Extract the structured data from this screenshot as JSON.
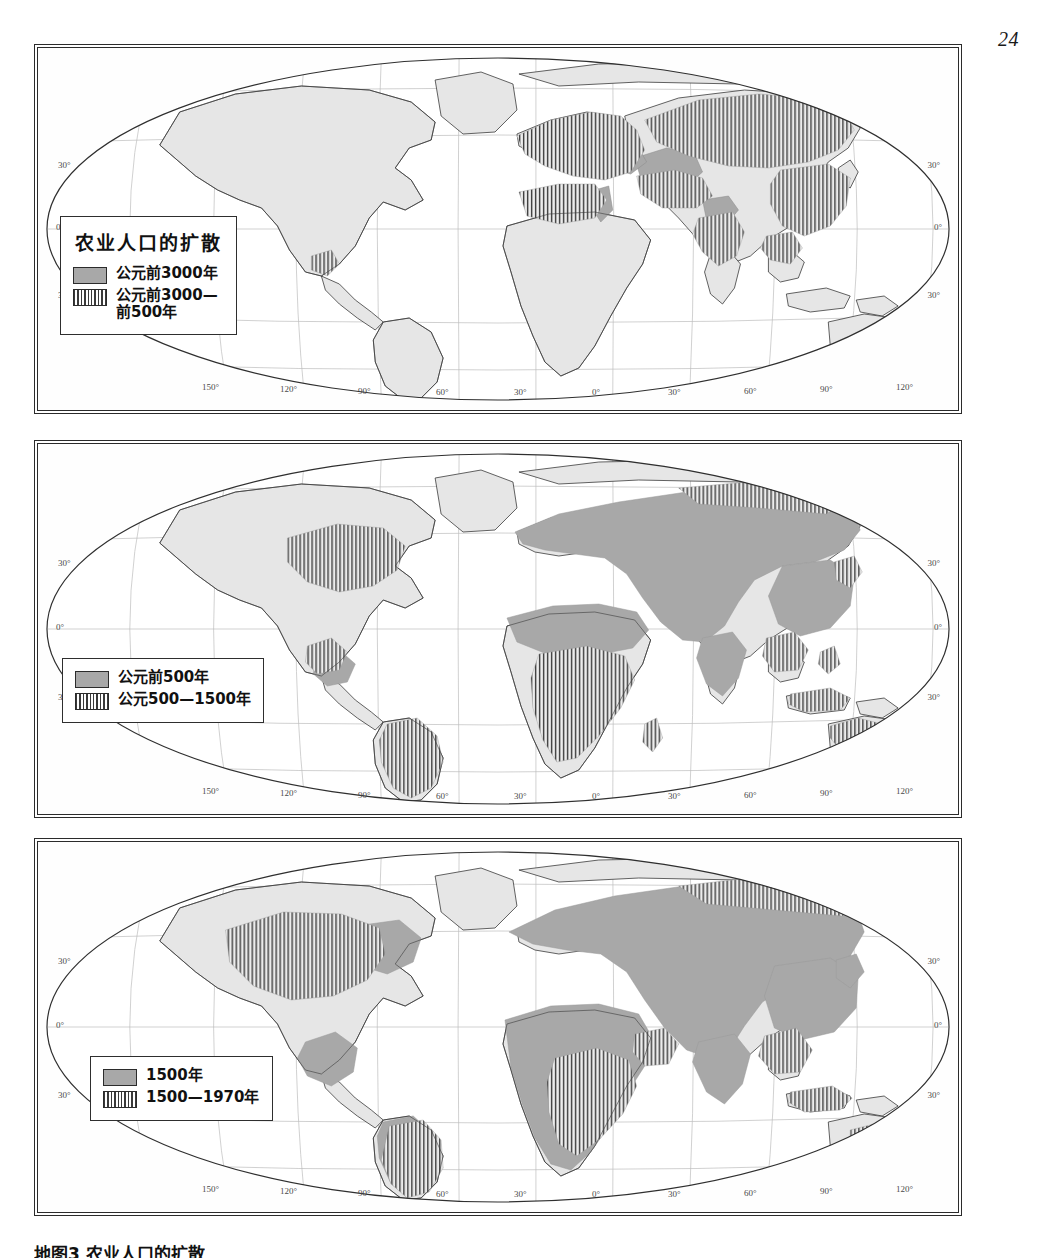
{
  "page": {
    "number": "24"
  },
  "caption": {
    "text": "地图3  农业人口的扩散"
  },
  "colors": {
    "land": "#e6e6e6",
    "solid_fill": "#a8a8a8",
    "hatch_line": "#3a3a3a",
    "coastline": "#333333",
    "graticule": "#b9b9b9",
    "frame": "#2b2b2b"
  },
  "maps": [
    {
      "id": "map-1",
      "legend": {
        "title": "农业人口的扩散",
        "entries": [
          {
            "swatch": "solid",
            "label": "公元前3000年"
          },
          {
            "swatch": "hatch",
            "label": "公元前3000—\n前500年"
          }
        ]
      },
      "latitude_labels": [
        "30°",
        "0°",
        "30°"
      ],
      "longitude_labels": [
        "150°",
        "120°",
        "90°",
        "60°",
        "30°",
        "0°",
        "30°",
        "60°",
        "90°",
        "120°",
        "150°"
      ]
    },
    {
      "id": "map-2",
      "legend": {
        "title": "",
        "entries": [
          {
            "swatch": "solid",
            "label": "公元前500年"
          },
          {
            "swatch": "hatch",
            "label": "公元500—1500年"
          }
        ]
      },
      "latitude_labels": [
        "30°",
        "0°",
        "30°"
      ],
      "longitude_labels": [
        "150°",
        "120°",
        "90°",
        "60°",
        "30°",
        "0°",
        "30°",
        "60°",
        "90°",
        "120°",
        "150°"
      ]
    },
    {
      "id": "map-3",
      "legend": {
        "title": "",
        "entries": [
          {
            "swatch": "solid",
            "label": "1500年"
          },
          {
            "swatch": "hatch",
            "label": "1500—1970年"
          }
        ]
      },
      "latitude_labels": [
        "30°",
        "0°",
        "30°"
      ],
      "longitude_labels": [
        "150°",
        "120°",
        "90°",
        "60°",
        "30°",
        "0°",
        "30°",
        "60°",
        "90°",
        "120°",
        "150°"
      ]
    }
  ]
}
